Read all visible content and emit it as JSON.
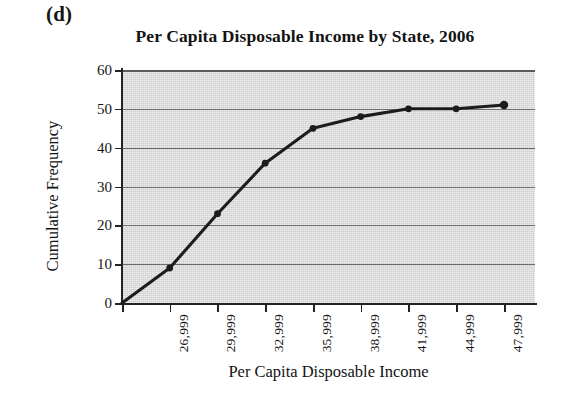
{
  "panel": {
    "label": "(d)"
  },
  "chart_data": {
    "type": "line",
    "title": "Per Capita Disposable Income by State, 2006",
    "xlabel": "Per Capita Disposable Income",
    "ylabel": "Cumulative Frequency",
    "categories": [
      "23,999",
      "26,999",
      "29,999",
      "32,999",
      "35,999",
      "38,999",
      "41,999",
      "44,999",
      "47,999"
    ],
    "tick_labels_shown": [
      "",
      "26,999",
      "29,999",
      "32,999",
      "35,999",
      "38,999",
      "41,999",
      "44,999",
      "47,999"
    ],
    "values": [
      0,
      9,
      23,
      36,
      45,
      48,
      50,
      50,
      51
    ],
    "ylim": [
      0,
      60
    ],
    "yticks": [
      0,
      10,
      20,
      30,
      40,
      50,
      60
    ],
    "grid": "horizontal",
    "legend": "none",
    "markers": "filled-circle",
    "series_color": "#1c1c1c",
    "plot_background": "#cfcfcf",
    "gridline_color": "#6e6e6e",
    "axis_color": "#232323"
  }
}
